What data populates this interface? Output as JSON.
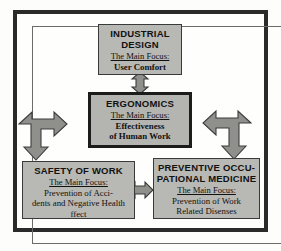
{
  "diagram": {
    "type": "relationship-diagram",
    "frame": {
      "border_color": "#2a2a2a"
    },
    "nodes": [
      {
        "id": "industrial-design",
        "title": "INDUSTRIAL DESIGN",
        "title_lines": [
          "INDUSTRIAL",
          "DESIGN"
        ],
        "focus_label": "The Main Focus:",
        "focus_value": "User Comfort",
        "focus_value_lines": [
          "User Comfort"
        ],
        "fill": "#b8b8b4",
        "emphasis": false
      },
      {
        "id": "ergonomics",
        "title": "ERGONOMICS",
        "title_lines": [
          "ERGONOMICS"
        ],
        "focus_label": "The Main Focus:",
        "focus_value": "Effectiveness of Human Work",
        "focus_value_lines": [
          "Effectiveness",
          "of Human Work"
        ],
        "fill": "#b4b4b0",
        "emphasis": true
      },
      {
        "id": "safety-of-work",
        "title": "SAFETY OF WORK",
        "title_lines": [
          "SAFETY OF WORK"
        ],
        "focus_label": "The Main Focus:",
        "focus_value": "Prevention of Accidents and Negative Health ffect",
        "focus_value_lines": [
          "Prevention of Acci-",
          "dents and Negative Health",
          "ffect"
        ],
        "fill": "#b8b8b4",
        "emphasis": false
      },
      {
        "id": "preventive-medicine",
        "title": "PREVENTIVE OCCUPATIONAL MEDICINE",
        "title_lines": [
          "PREVENTIVE OCCU-",
          "PATIONAL MEDICINE"
        ],
        "focus_label": "The Main Focus:",
        "focus_value": "Prevention of Work Related Disenses",
        "focus_value_lines": [
          "Prevention of Work",
          "Related Disenses"
        ],
        "fill": "#b8b8b4",
        "emphasis": false
      }
    ],
    "connectors": [
      {
        "id": "design-ergonomics",
        "name": "vertical-double-arrow",
        "from": "industrial-design",
        "to": "ergonomics",
        "direction": "bidirectional-vertical"
      },
      {
        "id": "ergonomics-safety",
        "name": "elbow-double-arrow-left",
        "from": "ergonomics",
        "to": "safety-of-work",
        "direction": "bidirectional-elbow"
      },
      {
        "id": "ergonomics-medicine",
        "name": "elbow-double-arrow-right",
        "from": "ergonomics",
        "to": "preventive-medicine",
        "direction": "bidirectional-elbow"
      },
      {
        "id": "safety-medicine",
        "name": "horizontal-double-arrow",
        "from": "safety-of-work",
        "to": "preventive-medicine",
        "direction": "bidirectional-horizontal"
      }
    ]
  }
}
